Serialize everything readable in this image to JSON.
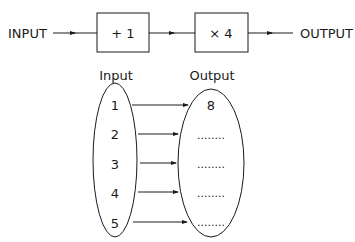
{
  "flow": {
    "input_label": "INPUT",
    "step1_label": "+ 1",
    "step2_label": "× 4",
    "output_label": "OUTPUT"
  },
  "mapping": {
    "input_header": "Input",
    "output_header": "Output",
    "inputs": [
      "1",
      "2",
      "3",
      "4",
      "5"
    ],
    "outputs": [
      "8",
      "........",
      "........",
      "........",
      "........"
    ]
  }
}
